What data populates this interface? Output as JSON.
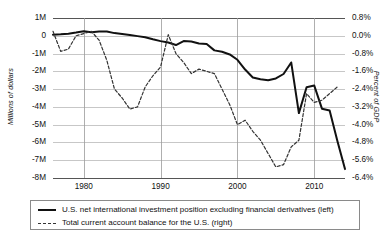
{
  "chart_data": {
    "type": "line",
    "title": "",
    "subtitle": "",
    "xlabel": "",
    "ylabel": "Millions of dollars",
    "y2label": "Percent of GDP",
    "grid": true,
    "legend_position": "bottom",
    "xlim": [
      1976,
      2014
    ],
    "xticks": [
      1980,
      1990,
      2000,
      2010
    ],
    "xtick_labels": [
      "1980",
      "1990",
      "2000",
      "2010"
    ],
    "ylim": [
      -8000000,
      1000000
    ],
    "yticks": [
      1000000,
      0,
      -1000000,
      -2000000,
      -3000000,
      -4000000,
      -5000000,
      -6000000,
      -7000000,
      -8000000
    ],
    "ytick_labels": [
      "1M",
      "0",
      "-1M",
      "-2M",
      "-3M",
      "-4M",
      "-5M",
      "-6M",
      "-7M",
      "-8M"
    ],
    "y2lim": [
      -6.4,
      0.8
    ],
    "y2ticks": [
      0.8,
      0.0,
      -0.8,
      -1.6,
      -2.4,
      -3.2,
      -4.0,
      -4.8,
      -5.6,
      -6.4
    ],
    "y2tick_labels": [
      "0.8%",
      "0.0%",
      "-0.8%",
      "-1.6%",
      "-2.4%",
      "-3.2%",
      "-4.0%",
      "-4.8%",
      "-5.6%",
      "-6.4%"
    ],
    "series": [
      {
        "name": "U.S. net international investment position excluding financial derivatives (left)",
        "axis": "left",
        "style": "solid",
        "color": "#111111",
        "x": [
          1976,
          1977,
          1978,
          1979,
          1980,
          1981,
          1982,
          1983,
          1984,
          1985,
          1986,
          1987,
          1988,
          1989,
          1990,
          1991,
          1992,
          1993,
          1994,
          1995,
          1996,
          1997,
          1998,
          1999,
          2000,
          2001,
          2002,
          2003,
          2004,
          2005,
          2006,
          2007,
          2008,
          2009,
          2010,
          2011,
          2012,
          2013,
          2014
        ],
        "y": [
          60000,
          80000,
          120000,
          180000,
          250000,
          200000,
          240000,
          245000,
          150000,
          100000,
          50000,
          -20000,
          -80000,
          -200000,
          -300000,
          -380000,
          -520000,
          -300000,
          -320000,
          -430000,
          -460000,
          -820000,
          -900000,
          -1050000,
          -1350000,
          -1900000,
          -2350000,
          -2450000,
          -2500000,
          -2400000,
          -2150000,
          -1500000,
          -4350000,
          -2900000,
          -2800000,
          -4100000,
          -4200000,
          -5900000,
          -7500000
        ]
      },
      {
        "name": "Total current account balance for the U.S. (right)",
        "axis": "right",
        "style": "dashed",
        "color": "#333333",
        "x": [
          1976,
          1977,
          1978,
          1979,
          1980,
          1981,
          1982,
          1983,
          1984,
          1985,
          1986,
          1987,
          1988,
          1989,
          1990,
          1991,
          1992,
          1993,
          1994,
          1995,
          1996,
          1997,
          1998,
          1999,
          2000,
          2001,
          2002,
          2003,
          2004,
          2005,
          2006,
          2007,
          2008,
          2009,
          2010,
          2011,
          2012,
          2013
        ],
        "y": [
          0.2,
          -0.7,
          -0.6,
          0.0,
          0.1,
          0.2,
          -0.2,
          -1.1,
          -2.4,
          -2.8,
          -3.3,
          -3.2,
          -2.3,
          -1.8,
          -1.4,
          0.05,
          -0.8,
          -1.2,
          -1.7,
          -1.5,
          -1.6,
          -1.7,
          -2.4,
          -3.1,
          -4.0,
          -3.8,
          -4.3,
          -4.7,
          -5.3,
          -5.9,
          -5.8,
          -5.0,
          -4.7,
          -2.6,
          -3.0,
          -2.9,
          -2.6,
          -2.3
        ]
      }
    ]
  },
  "legend": {
    "items": [
      {
        "label": "U.S. net international investment position excluding financial derivatives (left)",
        "style": "solid"
      },
      {
        "label": "Total current account balance for the U.S. (right)",
        "style": "dashed"
      }
    ]
  }
}
